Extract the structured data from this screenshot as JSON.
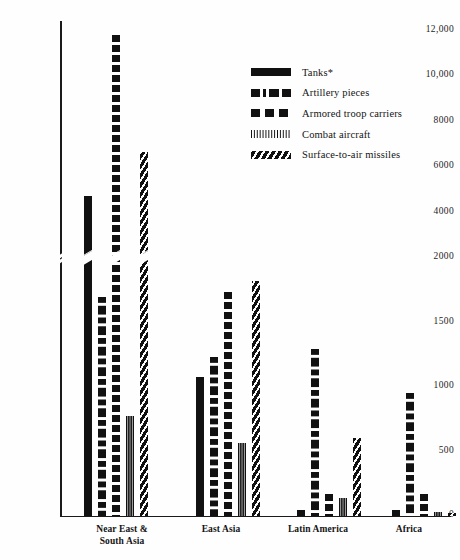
{
  "chart_data": {
    "type": "bar",
    "title": "",
    "subtitle": "",
    "xlabel": "",
    "ylabel": "",
    "grid": false,
    "legend_position": "upper-right",
    "broken_axis": true,
    "axis_break_note": "Y axis uses a broken scale: 0-2000 expanded, 2000-12000 compressed",
    "y_ticks_lower": [
      "0",
      "500",
      "1000",
      "1500",
      "2000"
    ],
    "y_ticks_upper": [
      "4000",
      "6000",
      "8000",
      "10,000",
      "12,000"
    ],
    "y_ticks_all": [
      "0",
      "500",
      "1000",
      "1500",
      "2000",
      "4000",
      "6000",
      "8000",
      "10,000",
      "12,000"
    ],
    "ylim": [
      0,
      12400
    ],
    "categories": [
      "Near East & South Asia",
      "East Asia",
      "Latin America",
      "Africa"
    ],
    "category_lines": [
      [
        "Near East &",
        "South Asia"
      ],
      [
        "East Asia"
      ],
      [
        "Latin America"
      ],
      [
        "Africa"
      ]
    ],
    "series": [
      {
        "name": "Tanks*",
        "pattern": "solid",
        "values": [
          4700,
          1080,
          40,
          40
        ]
      },
      {
        "name": "Artillery pieces",
        "pattern": "long-dash",
        "values": [
          1700,
          1230,
          1290,
          950
        ]
      },
      {
        "name": "Armored troop carriers",
        "pattern": "square-dash",
        "values": [
          11800,
          1740,
          170,
          170
        ]
      },
      {
        "name": "Combat aircraft",
        "pattern": "vertical-lines",
        "values": [
          775,
          560,
          140,
          25
        ]
      },
      {
        "name": "Surface-to-air missiles",
        "pattern": "diagonal-hatch",
        "values": [
          6650,
          1820,
          600,
          20
        ]
      }
    ]
  },
  "legend": {
    "items": [
      {
        "label": "Tanks*",
        "pattern": "solid"
      },
      {
        "label": "Artillery pieces",
        "pattern": "long-dash"
      },
      {
        "label": "Armored troop carriers",
        "pattern": "square-dash"
      },
      {
        "label": "Combat aircraft",
        "pattern": "vertical-lines"
      },
      {
        "label": "Surface-to-air missiles",
        "pattern": "diagonal-hatch"
      }
    ]
  },
  "colors": {
    "ink": "#111111",
    "background": "#fefefe",
    "axis": "#1a1a1a"
  }
}
